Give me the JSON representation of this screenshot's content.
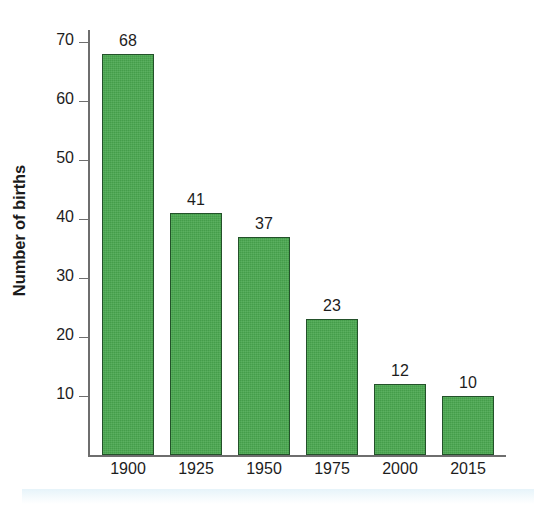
{
  "chart_data": {
    "type": "bar",
    "title": "",
    "xlabel": "",
    "ylabel": "Number of births",
    "categories": [
      "1900",
      "1925",
      "1950",
      "1975",
      "2000",
      "2015"
    ],
    "values": [
      68,
      41,
      37,
      23,
      12,
      10
    ],
    "value_labels": [
      "68",
      "41",
      "37",
      "23",
      "12",
      "10"
    ],
    "ylim": [
      0,
      72
    ],
    "yticks": [
      10,
      20,
      30,
      40,
      50,
      60,
      70
    ],
    "ytick_labels": [
      "10",
      "20",
      "30",
      "40",
      "50",
      "60",
      "70"
    ],
    "grid": false,
    "legend": false,
    "legend_position": "none",
    "bar_color": "#4aa850",
    "bar_border_color": "#23512a",
    "axis_color": "#6e6e6e",
    "text_color": "#1d1d1d",
    "background_color": "#ffffff"
  }
}
